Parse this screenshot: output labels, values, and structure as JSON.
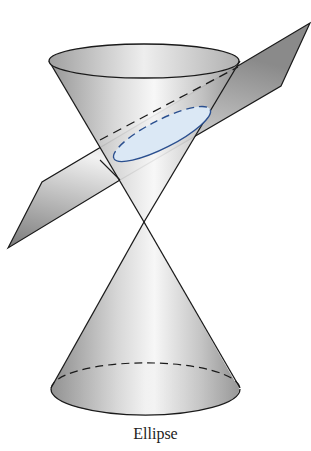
{
  "figure": {
    "caption": "Ellipse",
    "colors": {
      "ellipse_fill": "#dbe8f5",
      "ellipse_stroke": "#2a4f8f",
      "outline": "#1a1a1a",
      "surface_light": "#f4f4f4",
      "surface_dark": "#8a8a8a"
    }
  }
}
